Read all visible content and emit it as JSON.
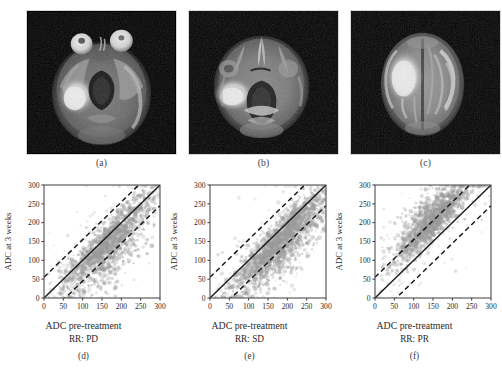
{
  "figure": {
    "panels_top": [
      {
        "letter": "(a)",
        "name": "adc-map-baseline"
      },
      {
        "letter": "(b)",
        "name": "adc-map-followup"
      },
      {
        "letter": "(c)",
        "name": "adc-map-superior"
      }
    ],
    "panels_bottom": [
      {
        "letter": "(d)",
        "rr": "RR: PD"
      },
      {
        "letter": "(e)",
        "rr": "RR: SD"
      },
      {
        "letter": "(f)",
        "rr": "RR: PR"
      }
    ]
  },
  "axes": {
    "xlabel": "ADC pre-treatment",
    "ylabel": "ADC at 3 weeks",
    "xticks": [
      "0",
      "50",
      "100",
      "150",
      "200",
      "250",
      "300"
    ],
    "yticks": [
      "0",
      "50",
      "100",
      "150",
      "200",
      "250",
      "300"
    ]
  },
  "colors": {
    "point": "#9a9a9a",
    "identity_line": "#1a1a1a",
    "limit_line": "#1a1a1a",
    "axis": "#3c3c3c",
    "mri_background": "#000000"
  },
  "chart_data": [
    {
      "type": "scatter",
      "id": "d",
      "title": "RR: PD",
      "xlabel": "ADC pre-treatment",
      "ylabel": "ADC at 3 weeks",
      "xlim": [
        0,
        300
      ],
      "ylim": [
        0,
        300
      ],
      "xticks": [
        0,
        50,
        100,
        150,
        200,
        250,
        300
      ],
      "yticks": [
        0,
        50,
        100,
        150,
        200,
        250,
        300
      ],
      "grid": false,
      "legend": null,
      "reference_lines": [
        {
          "name": "identity",
          "style": "solid",
          "slope": 1,
          "intercept": 0
        },
        {
          "name": "upper-limit-of-agreement",
          "style": "dashed",
          "slope": 1,
          "intercept": 55
        },
        {
          "name": "lower-limit-of-agreement",
          "style": "dashed",
          "slope": 1,
          "intercept": -55
        }
      ],
      "n_points": 1500,
      "cluster": {
        "x_center": 165,
        "x_spread": 58,
        "bias": -12,
        "scatter": 34,
        "tail_bias": -60,
        "tail_fraction": 0.3
      }
    },
    {
      "type": "scatter",
      "id": "e",
      "title": "RR: SD",
      "xlabel": "ADC pre-treatment",
      "ylabel": "ADC at 3 weeks",
      "xlim": [
        0,
        300
      ],
      "ylim": [
        0,
        300
      ],
      "xticks": [
        0,
        50,
        100,
        150,
        200,
        250,
        300
      ],
      "yticks": [
        0,
        50,
        100,
        150,
        200,
        250,
        300
      ],
      "grid": false,
      "legend": null,
      "reference_lines": [
        {
          "name": "identity",
          "style": "solid",
          "slope": 1,
          "intercept": 0
        },
        {
          "name": "upper-limit-of-agreement",
          "style": "dashed",
          "slope": 1,
          "intercept": 55
        },
        {
          "name": "lower-limit-of-agreement",
          "style": "dashed",
          "slope": 1,
          "intercept": -55
        }
      ],
      "n_points": 1900,
      "cluster": {
        "x_center": 185,
        "x_spread": 62,
        "bias": -22,
        "scatter": 30,
        "tail_bias": -55,
        "tail_fraction": 0.45
      }
    },
    {
      "type": "scatter",
      "id": "f",
      "title": "RR: PR",
      "xlabel": "ADC pre-treatment",
      "ylabel": "ADC at 3 weeks",
      "xlim": [
        0,
        300
      ],
      "ylim": [
        0,
        300
      ],
      "xticks": [
        0,
        50,
        100,
        150,
        200,
        250,
        300
      ],
      "yticks": [
        0,
        50,
        100,
        150,
        200,
        250,
        300
      ],
      "grid": false,
      "legend": null,
      "reference_lines": [
        {
          "name": "identity",
          "style": "solid",
          "slope": 1,
          "intercept": 0
        },
        {
          "name": "upper-limit-of-agreement",
          "style": "dashed",
          "slope": 1,
          "intercept": 55
        },
        {
          "name": "lower-limit-of-agreement",
          "style": "dashed",
          "slope": 1,
          "intercept": -55
        }
      ],
      "n_points": 1400,
      "cluster": {
        "x_center": 150,
        "x_spread": 48,
        "bias": 52,
        "scatter": 30,
        "tail_bias": 78,
        "tail_fraction": 0.4
      }
    }
  ]
}
